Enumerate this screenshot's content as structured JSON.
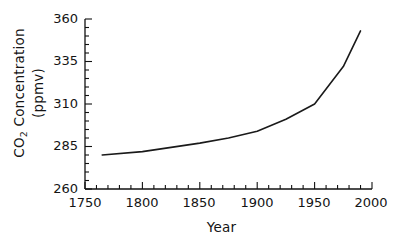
{
  "chart_data": {
    "type": "line",
    "title": "",
    "xlabel": "Year",
    "ylabel": "CO2 Concentration (ppmv)",
    "ylabel_line1": "CO",
    "ylabel_sub": "2",
    "ylabel_line1_rest": " Concentration",
    "ylabel_line2": "(ppmv)",
    "xlim": [
      1750,
      2000
    ],
    "ylim": [
      260,
      360
    ],
    "xticks": [
      1750,
      1800,
      1850,
      1900,
      1950,
      2000
    ],
    "xtick_labels": [
      "1750",
      "1800",
      "1850",
      "1900",
      "1950",
      "2000"
    ],
    "yticks": [
      260,
      285,
      310,
      335,
      360
    ],
    "ytick_labels": [
      "260",
      "285",
      "310",
      "335",
      "360"
    ],
    "x_minor_interval": 10,
    "y_minor_interval": 5,
    "grid": false,
    "legend": null,
    "line_color": "#1a1a1a",
    "line_width": 1.6,
    "series": [
      {
        "name": "CO2 concentration",
        "x": [
          1765,
          1800,
          1850,
          1875,
          1900,
          1925,
          1950,
          1975,
          1990
        ],
        "values": [
          280,
          282,
          287,
          290,
          294,
          301,
          310,
          332,
          353
        ]
      }
    ]
  },
  "figure": {
    "background": "#ffffff",
    "axis_color": "#111111",
    "text_color": "#141414"
  }
}
